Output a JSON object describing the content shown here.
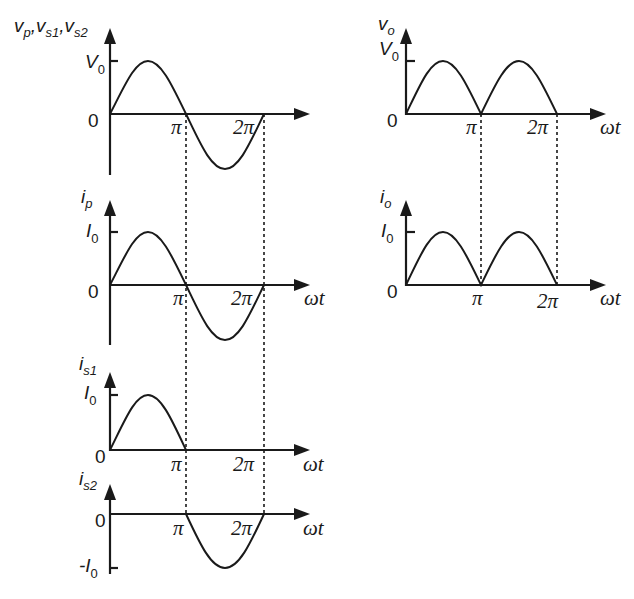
{
  "figure": {
    "panels": [
      {
        "id": "vp",
        "y_label_parts": [
          "v",
          "p",
          ",",
          "v",
          "s1",
          ",",
          "v",
          "s2"
        ],
        "y_label": "v_p, v_s1, v_s2",
        "peak_label": "V",
        "peak_sub": "0",
        "zero_label": "0",
        "x_label": "ωt",
        "ticks": [
          "π",
          "2π"
        ],
        "waveform": "full sine"
      },
      {
        "id": "ip",
        "y_label": "i_p",
        "peak_label": "I",
        "peak_sub": "0",
        "zero_label": "0",
        "x_label": "ωt",
        "ticks": [
          "π",
          "2π"
        ],
        "waveform": "full sine"
      },
      {
        "id": "is1",
        "y_label": "i_s1",
        "peak_label": "I",
        "peak_sub": "0",
        "zero_label": "0",
        "x_label": "ωt",
        "ticks": [
          "π",
          "2π"
        ],
        "waveform": "positive half only"
      },
      {
        "id": "is2",
        "y_label": "i_s2",
        "neg_label": "-I",
        "neg_sub": "0",
        "zero_label": "0",
        "x_label": "ωt",
        "ticks": [
          "π",
          "2π"
        ],
        "waveform": "negative half only"
      },
      {
        "id": "vo",
        "y_label": "v_o",
        "peak_label": "V",
        "peak_sub": "0",
        "zero_label": "0",
        "x_label": "ωt",
        "ticks": [
          "π",
          "2π"
        ],
        "waveform": "full-wave rectified"
      },
      {
        "id": "io",
        "y_label": "i_o",
        "peak_label": "I",
        "peak_sub": "0",
        "zero_label": "0",
        "x_label": "ωt",
        "ticks": [
          "π",
          "2π"
        ],
        "waveform": "full-wave rectified"
      }
    ],
    "text": {
      "v": "v",
      "i": "i",
      "p": "p",
      "s1": "s1",
      "s2": "s2",
      "o": "o",
      "comma": ",",
      "V": "V",
      "I": "I",
      "negI": "-I",
      "sub0": "0",
      "zero": "0",
      "pi": "π",
      "twopi": "2π",
      "wt": "ωt"
    }
  }
}
